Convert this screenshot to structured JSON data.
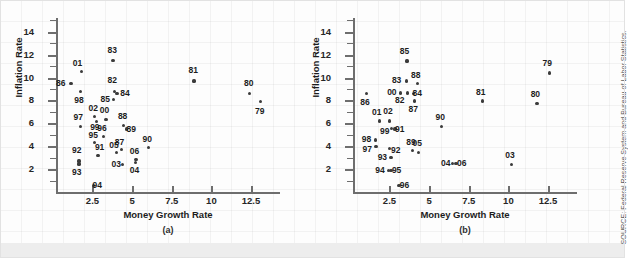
{
  "figure": {
    "source_note": "SOURCE: Federal Reserve System and Bureau of Labor Statistics."
  },
  "chart_data": [
    {
      "type": "scatter",
      "panel": "(a)",
      "title": "",
      "xlabel": "Money Growth Rate",
      "ylabel": "Inflation Rate",
      "xlim": [
        0.2,
        14.2
      ],
      "ylim": [
        0.0,
        15.2
      ],
      "xticks": [
        2.5,
        5,
        7.5,
        10,
        12.5
      ],
      "yticks": [
        2,
        4,
        6,
        8,
        10,
        12,
        14
      ],
      "grid": false,
      "legend": "none",
      "point_labels": [
        "79",
        "80",
        "81",
        "82",
        "83",
        "84",
        "85",
        "86",
        "87",
        "88",
        "89",
        "90",
        "91",
        "92",
        "93",
        "94",
        "95",
        "96",
        "97",
        "98",
        "99",
        "00",
        "01",
        "02",
        "03",
        "04",
        "05",
        "06"
      ],
      "points": [
        {
          "label": "79",
          "x": 13.1,
          "y": 7.9,
          "lx": 13.1,
          "ly": 7.0
        },
        {
          "label": "80",
          "x": 12.4,
          "y": 8.6,
          "lx": 12.4,
          "ly": 9.5
        },
        {
          "label": "81",
          "x": 8.9,
          "y": 9.7,
          "lx": 8.9,
          "ly": 10.6
        },
        {
          "label": "82",
          "x": 3.9,
          "y": 8.8,
          "lx": 3.8,
          "ly": 9.7
        },
        {
          "label": "83",
          "x": 3.8,
          "y": 11.5,
          "lx": 3.8,
          "ly": 12.4
        },
        {
          "label": "84",
          "x": 4.05,
          "y": 8.6,
          "lx": 4.6,
          "ly": 8.6
        },
        {
          "label": "85",
          "x": 3.85,
          "y": 8.1,
          "lx": 3.35,
          "ly": 8.1
        },
        {
          "label": "86",
          "x": 1.15,
          "y": 9.5,
          "lx": 0.55,
          "ly": 9.5
        },
        {
          "label": "87",
          "x": 4.35,
          "y": 3.7,
          "lx": 4.25,
          "ly": 4.3
        },
        {
          "label": "88",
          "x": 4.45,
          "y": 5.8,
          "lx": 4.45,
          "ly": 6.6
        },
        {
          "label": "89",
          "x": 4.65,
          "y": 5.5,
          "lx": 5.0,
          "ly": 5.5
        },
        {
          "label": "90",
          "x": 6.05,
          "y": 3.9,
          "lx": 6.0,
          "ly": 4.6
        },
        {
          "label": "91",
          "x": 2.85,
          "y": 3.2,
          "lx": 3.0,
          "ly": 3.9
        },
        {
          "label": "92",
          "x": 1.65,
          "y": 2.7,
          "lx": 1.55,
          "ly": 3.6
        },
        {
          "label": "93",
          "x": 1.65,
          "y": 2.45,
          "lx": 1.55,
          "ly": 1.7
        },
        {
          "label": "94",
          "x": 2.55,
          "y": 0.55,
          "lx": 2.85,
          "ly": 0.55
        },
        {
          "label": "95",
          "x": 2.65,
          "y": 4.3,
          "lx": 2.6,
          "ly": 4.95
        },
        {
          "label": "96",
          "x": 3.2,
          "y": 4.85,
          "lx": 3.15,
          "ly": 5.55
        },
        {
          "label": "97",
          "x": 1.75,
          "y": 5.75,
          "lx": 1.65,
          "ly": 6.5
        },
        {
          "label": "98",
          "x": 1.75,
          "y": 8.8,
          "lx": 1.7,
          "ly": 8.0
        },
        {
          "label": "99",
          "x": 2.75,
          "y": 6.15,
          "lx": 2.7,
          "ly": 5.6
        },
        {
          "label": "00",
          "x": 3.35,
          "y": 6.3,
          "lx": 3.3,
          "ly": 7.1
        },
        {
          "label": "01",
          "x": 1.8,
          "y": 10.5,
          "lx": 1.6,
          "ly": 11.2
        },
        {
          "label": "02",
          "x": 2.65,
          "y": 6.6,
          "lx": 2.6,
          "ly": 7.3
        },
        {
          "label": "03",
          "x": 4.4,
          "y": 2.4,
          "lx": 4.05,
          "ly": 2.4
        },
        {
          "label": "04",
          "x": 5.2,
          "y": 2.6,
          "lx": 5.2,
          "ly": 1.9
        },
        {
          "label": "05",
          "x": 4.0,
          "y": 3.45,
          "lx": 3.9,
          "ly": 4.1
        },
        {
          "label": "06",
          "x": 5.25,
          "y": 2.85,
          "lx": 5.2,
          "ly": 3.5
        }
      ]
    },
    {
      "type": "scatter",
      "panel": "(b)",
      "title": "",
      "xlabel": "Money Growth Rate",
      "ylabel": "Inflation Rate",
      "xlim": [
        0.2,
        14.2
      ],
      "ylim": [
        0.0,
        15.2
      ],
      "xticks": [
        2.5,
        5,
        7.5,
        10,
        12.5
      ],
      "yticks": [
        2,
        4,
        6,
        8,
        10,
        12,
        14
      ],
      "grid": false,
      "legend": "none",
      "point_labels": [
        "79",
        "80",
        "81",
        "82",
        "83",
        "84",
        "85",
        "86",
        "87",
        "88",
        "89",
        "90",
        "91",
        "92",
        "93",
        "94",
        "95",
        "96",
        "97",
        "98",
        "99",
        "00",
        "01",
        "02",
        "03",
        "04",
        "05",
        "06"
      ],
      "points": [
        {
          "label": "79",
          "x": 12.6,
          "y": 10.4,
          "lx": 12.5,
          "ly": 11.2
        },
        {
          "label": "80",
          "x": 11.8,
          "y": 7.75,
          "lx": 11.75,
          "ly": 8.5
        },
        {
          "label": "81",
          "x": 8.35,
          "y": 7.95,
          "lx": 8.3,
          "ly": 8.7
        },
        {
          "label": "82",
          "x": 3.65,
          "y": 8.65,
          "lx": 3.2,
          "ly": 8.0
        },
        {
          "label": "83",
          "x": 3.55,
          "y": 9.7,
          "lx": 3.0,
          "ly": 9.7
        },
        {
          "label": "84",
          "x": 4.0,
          "y": 8.6,
          "lx": 4.3,
          "ly": 8.6
        },
        {
          "label": "85",
          "x": 3.6,
          "y": 11.45,
          "lx": 3.5,
          "ly": 12.3
        },
        {
          "label": "86",
          "x": 1.05,
          "y": 8.6,
          "lx": 1.0,
          "ly": 7.8
        },
        {
          "label": "87",
          "x": 4.1,
          "y": 7.95,
          "lx": 4.05,
          "ly": 7.2
        },
        {
          "label": "88",
          "x": 4.25,
          "y": 9.45,
          "lx": 4.2,
          "ly": 10.2
        },
        {
          "label": "89",
          "x": 3.95,
          "y": 3.6,
          "lx": 3.9,
          "ly": 4.35
        },
        {
          "label": "90",
          "x": 5.8,
          "y": 5.75,
          "lx": 5.75,
          "ly": 6.5
        },
        {
          "label": "91",
          "x": 2.85,
          "y": 5.5,
          "lx": 3.2,
          "ly": 5.5
        },
        {
          "label": "92",
          "x": 2.5,
          "y": 3.8,
          "lx": 2.95,
          "ly": 3.6
        },
        {
          "label": "93",
          "x": 2.6,
          "y": 3.0,
          "lx": 2.1,
          "ly": 3.0
        },
        {
          "label": "94",
          "x": 2.45,
          "y": 1.85,
          "lx": 1.95,
          "ly": 1.85
        },
        {
          "label": "95",
          "x": 2.6,
          "y": 1.85,
          "lx": 3.0,
          "ly": 1.85
        },
        {
          "label": "96",
          "x": 3.1,
          "y": 0.6,
          "lx": 3.5,
          "ly": 0.6
        },
        {
          "label": "97",
          "x": 1.65,
          "y": 4.0,
          "lx": 1.15,
          "ly": 3.7
        },
        {
          "label": "98",
          "x": 1.6,
          "y": 4.55,
          "lx": 1.1,
          "ly": 4.6
        },
        {
          "label": "99",
          "x": 2.65,
          "y": 5.55,
          "lx": 2.25,
          "ly": 5.3
        },
        {
          "label": "00",
          "x": 3.2,
          "y": 8.65,
          "lx": 2.7,
          "ly": 8.65
        },
        {
          "label": "01",
          "x": 1.85,
          "y": 6.2,
          "lx": 1.75,
          "ly": 6.95
        },
        {
          "label": "02",
          "x": 2.5,
          "y": 6.2,
          "lx": 2.45,
          "ly": 7.0
        },
        {
          "label": "03",
          "x": 10.2,
          "y": 2.4,
          "lx": 10.15,
          "ly": 3.15
        },
        {
          "label": "04",
          "x": 6.5,
          "y": 2.5,
          "lx": 6.1,
          "ly": 2.5
        },
        {
          "label": "05",
          "x": 4.35,
          "y": 3.45,
          "lx": 4.3,
          "ly": 4.2
        },
        {
          "label": "06",
          "x": 6.7,
          "y": 2.5,
          "lx": 7.1,
          "ly": 2.5
        }
      ]
    }
  ]
}
